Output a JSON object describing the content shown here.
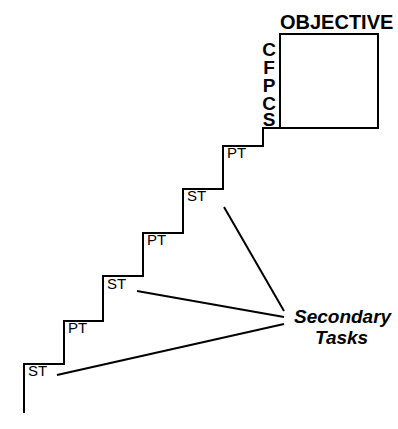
{
  "diagram": {
    "title_label": "OBJECTIVE",
    "objective_box": {
      "letters": [
        "C",
        "F",
        "P",
        "C",
        "S"
      ]
    },
    "secondary_annotation": {
      "line1": "Secondary",
      "line2": "Tasks"
    },
    "steps": [
      {
        "id": "step-1",
        "label": "ST"
      },
      {
        "id": "step-2",
        "label": "PT"
      },
      {
        "id": "step-3",
        "label": "ST"
      },
      {
        "id": "step-4",
        "label": "PT"
      },
      {
        "id": "step-5",
        "label": "ST"
      },
      {
        "id": "step-6",
        "label": "PT"
      }
    ],
    "colors": {
      "stroke": "#000000",
      "background": "#ffffff",
      "text": "#000000"
    }
  }
}
